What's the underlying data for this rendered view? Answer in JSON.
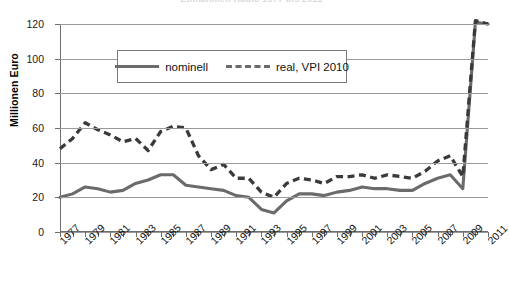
{
  "chart": {
    "title": "Einnahmen Radio 1977 bis 2011",
    "ylabel": "Millionen Euro",
    "xlabel": ""
  },
  "legend": {
    "position": "top-center-inside",
    "entries": [
      {
        "label": "nominell",
        "style": "solid",
        "color": "#6b6b6b"
      },
      {
        "label": "real, VPI 2010",
        "style": "dashed",
        "color": "#3a3a3a"
      }
    ]
  },
  "axes": {
    "y_ticks": [
      "120",
      "100",
      "80",
      "60",
      "40",
      "20",
      "0"
    ],
    "x_ticks": [
      "1977",
      "1979",
      "1981",
      "1983",
      "1985",
      "1987",
      "1989",
      "1991",
      "1993",
      "1995",
      "1997",
      "1999",
      "2001",
      "2003",
      "2005",
      "2007",
      "2009",
      "2011"
    ]
  },
  "chart_data": {
    "type": "line",
    "title": "Einnahmen Radio 1977 bis 2011",
    "xlabel": "",
    "ylabel": "Millionen Euro",
    "ylim": [
      0,
      120
    ],
    "xlim": [
      1977,
      2011
    ],
    "grid": true,
    "legend_position": "upper center",
    "x": [
      1977,
      1978,
      1979,
      1980,
      1981,
      1982,
      1983,
      1984,
      1985,
      1986,
      1987,
      1988,
      1989,
      1990,
      1991,
      1992,
      1993,
      1994,
      1995,
      1996,
      1997,
      1998,
      1999,
      2000,
      2001,
      2002,
      2003,
      2004,
      2005,
      2006,
      2007,
      2008,
      2009,
      2010,
      2011
    ],
    "series": [
      {
        "name": "nominell",
        "style": "solid",
        "color": "#6b6b6b",
        "values": [
          20,
          22,
          26,
          25,
          23,
          24,
          28,
          30,
          33,
          33,
          27,
          26,
          25,
          24,
          21,
          20,
          13,
          11,
          18,
          22,
          22,
          21,
          23,
          24,
          26,
          25,
          25,
          24,
          24,
          28,
          31,
          33,
          25,
          121,
          120
        ]
      },
      {
        "name": "real, VPI 2010",
        "style": "dashed",
        "color": "#3a3a3a",
        "values": [
          48,
          54,
          63,
          59,
          56,
          52,
          54,
          47,
          58,
          61,
          60,
          44,
          36,
          39,
          31,
          31,
          23,
          20,
          28,
          31,
          30,
          28,
          32,
          32,
          33,
          31,
          33,
          32,
          31,
          35,
          41,
          44,
          32,
          122,
          120
        ]
      }
    ]
  }
}
